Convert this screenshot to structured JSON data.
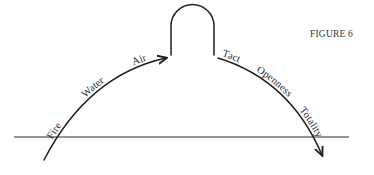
{
  "figure": {
    "caption": "FIGURE 6"
  },
  "left_arc": {
    "labels": [
      "Fire",
      "Water",
      "Air"
    ]
  },
  "right_arc": {
    "labels": [
      "Tact",
      "Openness",
      "Totality"
    ]
  },
  "colors": {
    "ink": "#1e1e1e",
    "background": "#ffffff"
  }
}
